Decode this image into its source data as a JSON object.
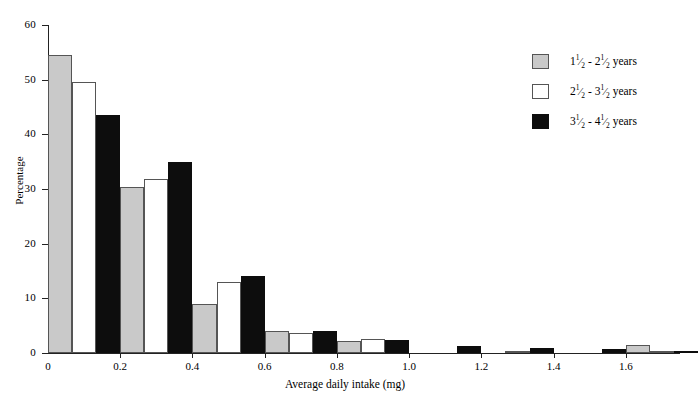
{
  "chart_data": {
    "type": "bar",
    "title": "",
    "xlabel": "Average daily intake (mg)",
    "ylabel": "Percentage",
    "xlim": [
      0,
      1.75
    ],
    "ylim": [
      0,
      60
    ],
    "xticks": [
      "0",
      "0.2",
      "0.4",
      "0.6",
      "0.8",
      "1.0",
      "1.2",
      "1.4",
      "1.6"
    ],
    "xtick_values": [
      0,
      0.2,
      0.4,
      0.6,
      0.8,
      1.0,
      1.2,
      1.4,
      1.6
    ],
    "yticks": [
      "0",
      "10",
      "20",
      "30",
      "40",
      "50",
      "60"
    ],
    "ytick_values": [
      0,
      10,
      20,
      30,
      40,
      50,
      60
    ],
    "grid": false,
    "legend_position": "right",
    "bin_width": 0.2,
    "bin_starts": [
      0.0,
      0.2,
      0.4,
      0.6,
      0.8,
      1.0,
      1.2,
      1.4,
      1.6
    ],
    "categories": [
      "0-0.2",
      "0.2-0.4",
      "0.4-0.6",
      "0.6-0.8",
      "0.8-1.0",
      "1.0-1.2",
      "1.2-1.4",
      "1.4-1.6",
      "1.6-1.8"
    ],
    "series": [
      {
        "name": "1 1/2 - 2 1/2 years",
        "color": "#c9c9c9",
        "values": [
          54.5,
          30.3,
          9.0,
          4.1,
          2.2,
          0.0,
          0.0,
          0.0,
          1.5
        ]
      },
      {
        "name": "2 1/2 - 3 1/2 years",
        "color": "#ffffff",
        "values": [
          49.5,
          31.8,
          13.0,
          3.7,
          2.5,
          0.0,
          0.3,
          0.0,
          0.4
        ]
      },
      {
        "name": "3 1/2 - 4 1/2 years",
        "color": "#0d0d0d",
        "values": [
          43.5,
          35.0,
          14.1,
          4.1,
          2.3,
          1.3,
          1.0,
          0.8,
          0.3
        ]
      }
    ]
  },
  "legend": {
    "items": [
      {
        "swatch": "s0",
        "from_whole": "1",
        "to_whole": "2",
        "num": "1",
        "den": "2",
        "unit": "years",
        "dash": "-"
      },
      {
        "swatch": "s1",
        "from_whole": "2",
        "to_whole": "3",
        "num": "1",
        "den": "2",
        "unit": "years",
        "dash": "-"
      },
      {
        "swatch": "s2",
        "from_whole": "3",
        "to_whole": "4",
        "num": "1",
        "den": "2",
        "unit": "years",
        "dash": "-"
      }
    ]
  },
  "axes": {
    "y_title": "Percentage",
    "x_title": "Average daily intake (mg)"
  }
}
